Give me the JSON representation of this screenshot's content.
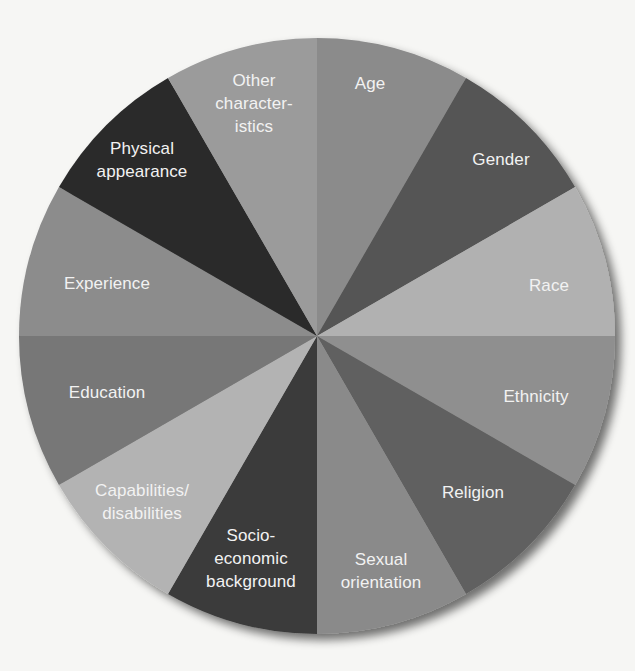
{
  "chart_data": {
    "type": "pie",
    "title": "",
    "center": [
      317,
      336
    ],
    "radius": 298,
    "start_angle_deg": 0,
    "direction": "clockwise",
    "categories": [
      "Age",
      "Gender",
      "Race",
      "Ethnicity",
      "Religion",
      "Sexual orientation",
      "Socio-economic background",
      "Capabilities/disabilities",
      "Education",
      "Experience",
      "Physical appearance",
      "Other characteristics"
    ],
    "values": [
      1,
      1,
      1,
      1,
      1,
      1,
      1,
      1,
      1,
      1,
      1,
      1
    ],
    "slices": [
      {
        "label": "Age",
        "text": "Age",
        "color": "#8b8b8b",
        "label_pos": [
          370,
          83
        ]
      },
      {
        "label": "Gender",
        "text": "Gender",
        "color": "#545454",
        "label_pos": [
          501,
          159
        ]
      },
      {
        "label": "Race",
        "text": "Race",
        "color": "#b1b1b1",
        "label_pos": [
          549,
          285
        ]
      },
      {
        "label": "Ethnicity",
        "text": "Ethnicity",
        "color": "#8f8f8f",
        "label_pos": [
          536,
          396
        ]
      },
      {
        "label": "Religion",
        "text": "Religion",
        "color": "#606060",
        "label_pos": [
          473,
          492
        ]
      },
      {
        "label": "Sexual orientation",
        "text": "Sexual\norientation",
        "color": "#8a8a8a",
        "label_pos": [
          381,
          571
        ]
      },
      {
        "label": "Socio-economic background",
        "text": "Socio-\neconomic\nbackground",
        "color": "#3b3b3b",
        "label_pos": [
          251,
          558
        ]
      },
      {
        "label": "Capabilities/disabilities",
        "text": "Capabilities/\ndisabilities",
        "color": "#b3b3b3",
        "label_pos": [
          142,
          502
        ]
      },
      {
        "label": "Education",
        "text": "Education",
        "color": "#777777",
        "label_pos": [
          107,
          392
        ]
      },
      {
        "label": "Experience",
        "text": "Experience",
        "color": "#8c8c8c",
        "label_pos": [
          107,
          283
        ]
      },
      {
        "label": "Physical appearance",
        "text": "Physical\nappearance",
        "color": "#2b2b2b",
        "label_pos": [
          142,
          160
        ]
      },
      {
        "label": "Other characteristics",
        "text": "Other\ncharacter-\nistics",
        "color": "#9b9b9b",
        "label_pos": [
          254,
          103
        ]
      }
    ],
    "label_color": "#f2f2f2",
    "legend": "none"
  }
}
